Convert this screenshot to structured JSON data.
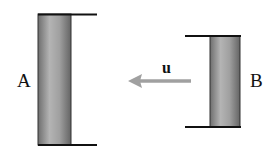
{
  "diagram": {
    "rod_a": {
      "label": "A"
    },
    "rod_b": {
      "label": "B"
    },
    "velocity": {
      "label": "u",
      "direction": "left",
      "color": "#a0a0a0"
    },
    "colors": {
      "frame_line": "#111111",
      "rod_fill_light": "#b8b8b8",
      "rod_fill_dark": "#707070"
    }
  }
}
